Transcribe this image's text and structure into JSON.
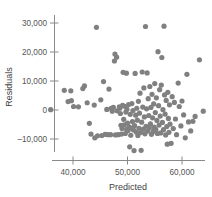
{
  "chart_data": {
    "type": "scatter",
    "title": "",
    "xlabel": "Predicted",
    "ylabel": "Residuals",
    "xlim": [
      35000,
      64500
    ],
    "ylim": [
      -14500,
      31500
    ],
    "xticks": [
      40000,
      50000,
      60000
    ],
    "xtick_labels": [
      "40,000",
      "50,000",
      "60,000"
    ],
    "yticks": [
      -10000,
      0,
      10000,
      20000,
      30000
    ],
    "ytick_labels": [
      "–10,000",
      "0",
      "10,000",
      "20,000",
      "30,000"
    ],
    "grid": false,
    "legend": null,
    "marker_color": "#808080",
    "marker_size": 2.6,
    "n_points": 148,
    "points": [
      [
        35900,
        100
      ],
      [
        38400,
        6800
      ],
      [
        39100,
        2900
      ],
      [
        39600,
        6600
      ],
      [
        39700,
        3200
      ],
      [
        40100,
        1200
      ],
      [
        41000,
        1100
      ],
      [
        41800,
        7400
      ],
      [
        42100,
        8300
      ],
      [
        42600,
        2500
      ],
      [
        43000,
        -4600
      ],
      [
        43300,
        -8300
      ],
      [
        43900,
        1700
      ],
      [
        44000,
        -9600
      ],
      [
        44300,
        28500
      ],
      [
        44500,
        -8900
      ],
      [
        45100,
        3500
      ],
      [
        45300,
        -8800
      ],
      [
        45600,
        9800
      ],
      [
        45900,
        -8400
      ],
      [
        46200,
        200
      ],
      [
        46400,
        -8500
      ],
      [
        46600,
        7200
      ],
      [
        46900,
        -8500
      ],
      [
        47000,
        600
      ],
      [
        47200,
        -400
      ],
      [
        47400,
        900
      ],
      [
        47600,
        16900
      ],
      [
        47700,
        19300
      ],
      [
        47800,
        -8600
      ],
      [
        48000,
        18200
      ],
      [
        48100,
        -300
      ],
      [
        48300,
        -8500
      ],
      [
        48500,
        1100
      ],
      [
        48600,
        600
      ],
      [
        48700,
        -1200
      ],
      [
        48800,
        -5300
      ],
      [
        48900,
        -8300
      ],
      [
        49000,
        -6400
      ],
      [
        49100,
        1600
      ],
      [
        49200,
        13000
      ],
      [
        49300,
        -3200
      ],
      [
        49400,
        -5100
      ],
      [
        49500,
        1300
      ],
      [
        49600,
        -8100
      ],
      [
        49700,
        -700
      ],
      [
        49800,
        12700
      ],
      [
        49850,
        -6700
      ],
      [
        49900,
        300
      ],
      [
        50000,
        -4500
      ],
      [
        50100,
        -7100
      ],
      [
        50200,
        1900
      ],
      [
        50300,
        -5800
      ],
      [
        50400,
        -12700
      ],
      [
        50500,
        -1500
      ],
      [
        50600,
        -8700
      ],
      [
        50700,
        -6200
      ],
      [
        50800,
        2200
      ],
      [
        50900,
        -4000
      ],
      [
        51000,
        -200
      ],
      [
        51100,
        -6900
      ],
      [
        51200,
        -14000
      ],
      [
        51300,
        -5400
      ],
      [
        51400,
        12600
      ],
      [
        51500,
        -1800
      ],
      [
        51600,
        -7600
      ],
      [
        51700,
        600
      ],
      [
        51800,
        -3500
      ],
      [
        51900,
        -8800
      ],
      [
        52000,
        3000
      ],
      [
        52100,
        -6300
      ],
      [
        52200,
        -1100
      ],
      [
        52300,
        5800
      ],
      [
        52400,
        -7800
      ],
      [
        52500,
        -13900
      ],
      [
        52600,
        -4200
      ],
      [
        52700,
        13100
      ],
      [
        52800,
        1000
      ],
      [
        52900,
        -6600
      ],
      [
        53000,
        7600
      ],
      [
        53100,
        -2400
      ],
      [
        53200,
        -8200
      ],
      [
        53300,
        28800
      ],
      [
        53400,
        -5600
      ],
      [
        53500,
        400
      ],
      [
        53600,
        12800
      ],
      [
        53700,
        -7200
      ],
      [
        53800,
        3900
      ],
      [
        53900,
        -1900
      ],
      [
        54000,
        -6100
      ],
      [
        54100,
        8100
      ],
      [
        54200,
        -4800
      ],
      [
        54300,
        900
      ],
      [
        54400,
        -8400
      ],
      [
        54500,
        5400
      ],
      [
        54600,
        -2700
      ],
      [
        54700,
        -7400
      ],
      [
        54800,
        2100
      ],
      [
        54900,
        -5900
      ],
      [
        55000,
        9100
      ],
      [
        55100,
        -900
      ],
      [
        55200,
        -6700
      ],
      [
        55300,
        4200
      ],
      [
        55400,
        -3600
      ],
      [
        55500,
        -8100
      ],
      [
        55600,
        20100
      ],
      [
        55700,
        1500
      ],
      [
        55800,
        -5200
      ],
      [
        55900,
        7000
      ],
      [
        56000,
        -2100
      ],
      [
        56100,
        -7900
      ],
      [
        56200,
        8600
      ],
      [
        56300,
        18100
      ],
      [
        56400,
        -4300
      ],
      [
        56500,
        100
      ],
      [
        56600,
        -6800
      ],
      [
        56700,
        28900
      ],
      [
        56800,
        5200
      ],
      [
        56900,
        -1400
      ],
      [
        57000,
        -8600
      ],
      [
        57100,
        3300
      ],
      [
        57200,
        -5700
      ],
      [
        57300,
        -11800
      ],
      [
        57400,
        6100
      ],
      [
        57500,
        -2900
      ],
      [
        57600,
        -7700
      ],
      [
        57700,
        1800
      ],
      [
        57800,
        -4900
      ],
      [
        58000,
        -11500
      ],
      [
        58200,
        4600
      ],
      [
        58400,
        -6400
      ],
      [
        58600,
        2600
      ],
      [
        58800,
        -3100
      ],
      [
        59000,
        -8500
      ],
      [
        59300,
        9300
      ],
      [
        59500,
        1200
      ],
      [
        59800,
        -5500
      ],
      [
        60000,
        3100
      ],
      [
        60300,
        -1700
      ],
      [
        60600,
        -9600
      ],
      [
        60900,
        12300
      ],
      [
        61200,
        -4100
      ],
      [
        61600,
        -7200
      ],
      [
        62000,
        -3900
      ],
      [
        62400,
        -2200
      ],
      [
        63200,
        17300
      ],
      [
        63900,
        -400
      ]
    ]
  }
}
